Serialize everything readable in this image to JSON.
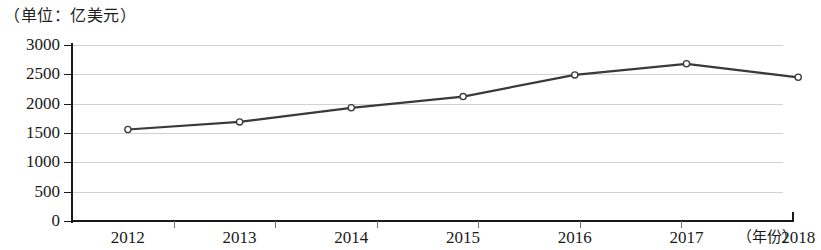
{
  "chart_data": {
    "type": "line",
    "title": "（单位：亿美元）",
    "xlabel": "（年份）",
    "ylabel": "",
    "categories": [
      "2012",
      "2013",
      "2014",
      "2015",
      "2016",
      "2017",
      "2018"
    ],
    "values": [
      1560,
      1690,
      1930,
      2120,
      2490,
      2680,
      2450
    ],
    "series": [
      {
        "name": "亿美元",
        "values": [
          1560,
          1690,
          1930,
          2120,
          2490,
          2680,
          2450
        ]
      }
    ],
    "ylim": [
      0,
      3000
    ],
    "yticks": [
      "0",
      "500",
      "1000",
      "1500",
      "2000",
      "2500",
      "3000"
    ],
    "ytick_values": [
      0,
      500,
      1000,
      1500,
      2000,
      2500,
      3000
    ],
    "xticks": [
      "2012",
      "2013",
      "2014",
      "2015",
      "2016",
      "2017",
      "2018"
    ],
    "grid": true,
    "legend": false,
    "legend_position": "none",
    "markers": "circle",
    "line_color": "#3a3a3a",
    "grid_color": "#d2d2d2",
    "axis_color": "#1a1a1a",
    "marker_fill": "#ffffff"
  },
  "caption": {
    "unit_label": "（单位：亿美元）"
  }
}
